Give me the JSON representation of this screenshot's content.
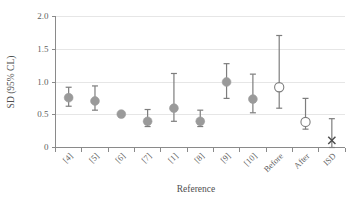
{
  "chart_data": {
    "type": "scatter",
    "title": "",
    "subtitle": "",
    "xlabel": "Reference",
    "ylabel": "SD (95% CL)",
    "categories": [
      "[4]",
      "[5]",
      "[6]",
      "[7]",
      "[1]",
      "[8]",
      "[9]",
      "[10]",
      "Before",
      "After",
      "ISD"
    ],
    "values": [
      0.76,
      0.71,
      0.51,
      0.4,
      0.6,
      0.4,
      1.0,
      0.74,
      0.92,
      0.39,
      0.11
    ],
    "error_low": [
      0.63,
      0.57,
      0.5,
      0.32,
      0.4,
      0.32,
      0.75,
      0.53,
      0.6,
      0.28,
      0.0
    ],
    "error_high": [
      0.92,
      0.94,
      0.53,
      0.58,
      1.13,
      0.57,
      1.28,
      1.12,
      1.71,
      0.75,
      0.44
    ],
    "marker_styles": [
      "filled",
      "filled",
      "filled",
      "filled",
      "filled",
      "filled",
      "filled",
      "filled",
      "open",
      "open",
      "cross"
    ],
    "ylim": [
      0,
      2.0
    ],
    "yticks": [
      0,
      0.5,
      1.0,
      1.5,
      2.0
    ],
    "ytick_labels": [
      "0",
      "0.5",
      "1.0",
      "1.5",
      "2.0"
    ],
    "grid": "horizontal",
    "legend": "none",
    "legend_position": "none",
    "annotations": [],
    "colors": {
      "marker_fill": "#9a9a9a",
      "marker_open_stroke": "#7d7d7d",
      "cross_stroke": "#4a4a4a",
      "error_bar": "#7d7d7d",
      "axis": "#8a8a8a",
      "gridline": "#e6e6e6",
      "text": "#5f5f5f",
      "background": "#ffffff"
    }
  }
}
